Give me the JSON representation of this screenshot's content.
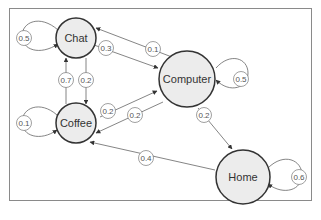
{
  "diagram": {
    "type": "markov-chain",
    "nodes": {
      "chat": {
        "label": "Chat"
      },
      "coffee": {
        "label": "Coffee"
      },
      "computer": {
        "label": "Computer"
      },
      "home": {
        "label": "Home"
      }
    },
    "edges": {
      "chat_chat": {
        "from": "Chat",
        "to": "Chat",
        "label": "0.5"
      },
      "chat_computer": {
        "from": "Chat",
        "to": "Computer",
        "label": "0.3"
      },
      "computer_chat": {
        "from": "Computer",
        "to": "Chat",
        "label": "0.1"
      },
      "chat_coffee": {
        "from": "Chat",
        "to": "Coffee",
        "label": "0.2"
      },
      "coffee_chat": {
        "from": "Coffee",
        "to": "Chat",
        "label": "0.7"
      },
      "coffee_coffee": {
        "from": "Coffee",
        "to": "Coffee",
        "label": "0.1"
      },
      "coffee_computer": {
        "from": "Coffee",
        "to": "Computer",
        "label": "0.2"
      },
      "computer_coffee": {
        "from": "Computer",
        "to": "Coffee",
        "label": "0.2"
      },
      "computer_computer": {
        "from": "Computer",
        "to": "Computer",
        "label": "0.5"
      },
      "computer_home": {
        "from": "Computer",
        "to": "Home",
        "label": "0.2"
      },
      "home_coffee": {
        "from": "Home",
        "to": "Coffee",
        "label": "0.4"
      },
      "home_home": {
        "from": "Home",
        "to": "Home",
        "label": "0.6"
      }
    }
  },
  "colors": {
    "node_fill": "#ececec",
    "node_stroke": "#333333",
    "edge_stroke": "#555555",
    "frame_stroke": "#8a8a8a"
  }
}
